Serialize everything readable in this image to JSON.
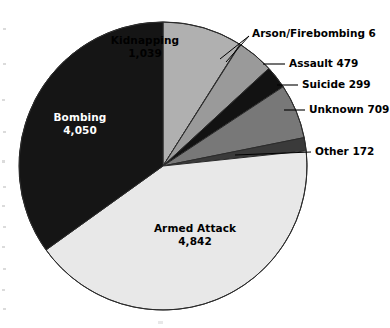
{
  "figure": {
    "kind": "pie-chart",
    "background": "#ffffff",
    "total": 11596
  },
  "chart_data": {
    "type": "pie",
    "title": "",
    "subtitle": "",
    "xlabel": "",
    "ylabel": "",
    "grid": false,
    "legend_position": "none",
    "label_style": "slice-labels-and-leader-callouts",
    "start_angle_deg": 0,
    "direction": "clockwise",
    "total": 11596,
    "categories": [
      "Kidnapping",
      "Arson/Firebombing",
      "Assault",
      "Suicide",
      "Unknown",
      "Other",
      "Armed Attack",
      "Bombing"
    ],
    "values": [
      1039,
      6,
      479,
      299,
      709,
      172,
      4842,
      4050
    ],
    "value_labels": [
      "1,039",
      "6",
      "479",
      "299",
      "709",
      "172",
      "4,842",
      "4,050"
    ],
    "slices": [
      {
        "name": "Kidnapping",
        "value": 1039,
        "value_label": "1,039",
        "color": "#b0b0b0",
        "text_color": "#000000",
        "label_placement": "inside",
        "start_deg": 0.0,
        "end_deg": 32.26
      },
      {
        "name": "Arson/Firebombing",
        "value": 6,
        "value_label": "6",
        "color": "#6e6e6e",
        "text_color": "#000000",
        "label_placement": "callout",
        "start_deg": 32.26,
        "end_deg": 32.45
      },
      {
        "name": "Assault",
        "value": 479,
        "value_label": "479",
        "color": "#9a9a9a",
        "text_color": "#000000",
        "label_placement": "callout",
        "start_deg": 32.45,
        "end_deg": 47.33
      },
      {
        "name": "Suicide",
        "value": 299,
        "value_label": "299",
        "color": "#121212",
        "text_color": "#000000",
        "label_placement": "callout",
        "start_deg": 47.33,
        "end_deg": 56.61
      },
      {
        "name": "Unknown",
        "value": 709,
        "value_label": "709",
        "color": "#787878",
        "text_color": "#000000",
        "label_placement": "callout",
        "start_deg": 56.61,
        "end_deg": 78.63
      },
      {
        "name": "Other",
        "value": 172,
        "value_label": "172",
        "color": "#3a3a3a",
        "text_color": "#000000",
        "label_placement": "callout",
        "start_deg": 78.63,
        "end_deg": 83.97
      },
      {
        "name": "Armed Attack",
        "value": 4842,
        "value_label": "4,842",
        "color": "#e8e8e8",
        "text_color": "#000000",
        "label_placement": "inside",
        "start_deg": 83.97,
        "end_deg": 234.33
      },
      {
        "name": "Bombing",
        "value": 4050,
        "value_label": "4,050",
        "color": "#151515",
        "text_color": "#ffffff",
        "label_placement": "inside",
        "start_deg": 234.33,
        "end_deg": 360.0
      }
    ],
    "callouts": [
      {
        "name": "Arson/Firebombing",
        "text": "Arson/Firebombing 6"
      },
      {
        "name": "Assault",
        "text": "Assault 479"
      },
      {
        "name": "Suicide",
        "text": "Suicide 299"
      },
      {
        "name": "Unknown",
        "text": "Unknown 709"
      },
      {
        "name": "Other",
        "text": "Other 172"
      }
    ],
    "inside_labels": [
      {
        "name": "Kidnapping",
        "label": "Kidnapping",
        "value_label": "1,039"
      },
      {
        "name": "Bombing",
        "label": "Bombing",
        "value_label": "4,050"
      },
      {
        "name": "Armed Attack",
        "label": "Armed Attack",
        "value_label": "4,842"
      }
    ]
  },
  "labels": {
    "kidnapping": {
      "name": "Kidnapping",
      "value": "1,039"
    },
    "bombing": {
      "name": "Bombing",
      "value": "4,050"
    },
    "armed_attack": {
      "name": "Armed Attack",
      "value": "4,842"
    },
    "arson": "Arson/Firebombing 6",
    "assault": "Assault 479",
    "suicide": "Suicide 299",
    "unknown": "Unknown 709",
    "other": "Other 172"
  },
  "colors": {
    "kidnapping": "#b0b0b0",
    "arson": "#6e6e6e",
    "assault": "#9a9a9a",
    "suicide": "#121212",
    "unknown": "#787878",
    "other": "#3a3a3a",
    "armed_attack": "#e8e8e8",
    "bombing": "#151515",
    "outline": "#2b2b2b",
    "leader": "#000000",
    "background": "#ffffff"
  }
}
